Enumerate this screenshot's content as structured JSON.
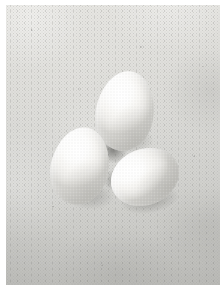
{
  "image": {
    "domain": "Natural-Image",
    "subject": "three white chicken eggs",
    "scene_description": "Three white eggs arranged in a triangle on a mottled light-gray concrete surface",
    "orientation": "portrait",
    "width_px": 224,
    "height_px": 286,
    "border": {
      "present": true,
      "color": "#ffffff",
      "left_px": 6,
      "top_px": 5,
      "right_px": 4,
      "bottom_px": 1
    },
    "palette": {
      "background_light": "#e3e3e0",
      "background_mid": "#d8d8d5",
      "background_dark": "#c5c5c2",
      "egg_highlight": "#ffffff",
      "egg_midtone": "#f4f3f0",
      "egg_shade": "#d6d5d1",
      "shadow": "#6a6a66",
      "deep_shadow": "#4e4e4b"
    },
    "lighting": {
      "direction": "upper-left, soft diffuse",
      "contrast": "low",
      "notes": "soft gradient falloff toward the lower-right and a gentle vignette at the frame edges"
    },
    "texture": {
      "surface": "fine-grained speckled concrete or stone",
      "grain": "visible photographic film grain across the whole frame"
    },
    "objects": [
      {
        "id": "egg-top",
        "label": "top egg",
        "pose": "upright, narrow end pointing up",
        "rotation_deg": 9,
        "bbox": {
          "x": 90,
          "y": 66,
          "w": 58,
          "h": 80
        }
      },
      {
        "id": "egg-left",
        "label": "left egg",
        "pose": "upright, leaning slightly right",
        "rotation_deg": 12,
        "bbox": {
          "x": 45,
          "y": 122,
          "w": 58,
          "h": 78
        }
      },
      {
        "id": "egg-right",
        "label": "right egg",
        "pose": "lying on its side, long axis tilted up to the right",
        "rotation_deg": -22,
        "bbox": {
          "x": 104,
          "y": 144,
          "w": 70,
          "h": 56
        }
      }
    ],
    "shadows": [
      {
        "id": "shadow-top",
        "label": "cast shadow under the top egg"
      },
      {
        "id": "shadow-left",
        "label": "cast shadow under the left egg"
      },
      {
        "id": "shadow-right",
        "label": "cast shadow under the right egg"
      },
      {
        "id": "shadow-center",
        "label": "deep occlusion shadow where the three eggs meet"
      },
      {
        "id": "shadow-gap-lr",
        "label": "contact shadow between the left and right eggs"
      }
    ],
    "object_count": 3
  }
}
